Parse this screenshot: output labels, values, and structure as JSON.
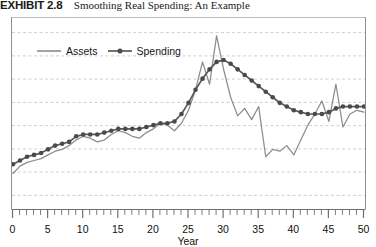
{
  "exhibit": {
    "label": "EXHIBIT 2.8",
    "title": "Smoothing Real Spending: An Example"
  },
  "colors": {
    "assets_line": "#8c8c8c",
    "spending_line": "#5a5a5a",
    "spending_marker": "#4a4a4a",
    "gridline": "#c9c9c9",
    "axis": "#6f6f6f",
    "text": "#111111"
  },
  "legend": {
    "position": "top-left-inside",
    "entries": [
      {
        "label": "Assets",
        "style": "line",
        "name": "legend-assets"
      },
      {
        "label": "Spending",
        "style": "line-with-marker",
        "name": "legend-spending"
      }
    ]
  },
  "axis": {
    "x": {
      "label": "Year",
      "min": 0,
      "max": 50,
      "major_step": 5,
      "minor_step": 1,
      "tick_labels": [
        "0",
        "5",
        "10",
        "15",
        "20",
        "25",
        "30",
        "35",
        "40",
        "45",
        "50"
      ]
    },
    "y": {
      "label": "",
      "tick_labels": [],
      "gridlines": 8,
      "grid_style": "dashed"
    }
  },
  "chart_data": {
    "type": "line",
    "title": "Smoothing Real Spending: An Example",
    "xlabel": "Year",
    "ylabel": "",
    "xlim": [
      0,
      50
    ],
    "ylim": [
      0,
      100
    ],
    "grid": true,
    "legend_position": "upper left",
    "x": [
      0,
      1,
      2,
      3,
      4,
      5,
      6,
      7,
      8,
      9,
      10,
      11,
      12,
      13,
      14,
      15,
      16,
      17,
      18,
      19,
      20,
      21,
      22,
      23,
      24,
      25,
      26,
      27,
      28,
      29,
      30,
      31,
      32,
      33,
      34,
      35,
      36,
      37,
      38,
      39,
      40,
      41,
      42,
      43,
      44,
      45,
      46,
      47,
      48,
      49,
      50
    ],
    "series": [
      {
        "name": "Assets",
        "style": "line",
        "marker": "none",
        "values": [
          18,
          22,
          24,
          25,
          26,
          28,
          30,
          31,
          33,
          36,
          38,
          37,
          35,
          36,
          39,
          41,
          40,
          38,
          37,
          40,
          42,
          45,
          44,
          41,
          45,
          52,
          63,
          78,
          66,
          92,
          74,
          59,
          49,
          53,
          47,
          54,
          27,
          31,
          30,
          33,
          28,
          36,
          44,
          50,
          57,
          46,
          66,
          43,
          50,
          52,
          51
        ]
      },
      {
        "name": "Spending",
        "style": "line",
        "marker": "circle",
        "values": [
          23,
          25,
          27,
          28,
          29,
          31,
          33,
          34,
          35,
          38,
          39,
          39,
          39,
          40,
          41,
          42,
          42,
          42,
          42,
          43,
          44,
          45,
          45,
          46,
          50,
          56,
          63,
          69,
          74,
          78,
          79,
          77,
          74,
          71,
          68,
          65,
          62,
          59,
          56,
          54,
          52,
          51,
          50,
          50,
          50,
          51,
          53,
          54,
          54,
          54,
          54
        ]
      }
    ]
  }
}
